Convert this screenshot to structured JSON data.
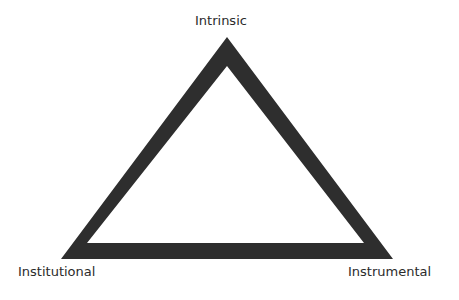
{
  "diagram": {
    "type": "triangle",
    "stroke_color": "#2e2e2e",
    "background": "#ffffff",
    "vertices": {
      "top": {
        "label": "Intrinsic"
      },
      "bottom_left": {
        "label": "Institutional"
      },
      "bottom_right": {
        "label": "Instrumental"
      }
    }
  }
}
